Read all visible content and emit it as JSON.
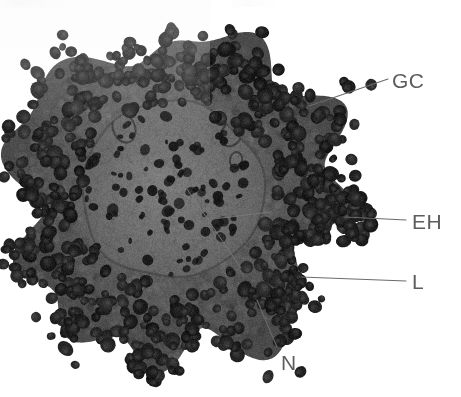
{
  "figure": {
    "kind": "histology-micrograph",
    "stain_tone": "grayscale",
    "background_color": "#ffffff",
    "width_px": 461,
    "height_px": 397
  },
  "specimen": {
    "center_x": 175,
    "center_y": 196,
    "outer_radius": 163,
    "oocyte_center_x": 172,
    "oocyte_center_y": 190,
    "oocyte_radius": 88,
    "matrix_color": "#585858",
    "oocyte_color": "#6d6d6d",
    "cell_color": "#262626",
    "cell_count": 620,
    "inner_nuclei_count": 95
  },
  "annotations": {
    "labels": [
      {
        "id": "gc",
        "text": "GC",
        "meaning": "granulosa cells",
        "color": "#5d5d5d",
        "label_x": 392,
        "label_y": 70,
        "leader": {
          "x1": 388,
          "y1": 79,
          "x2": 309,
          "y2": 106
        }
      },
      {
        "id": "eh",
        "text": "EH",
        "meaning": "epithelial hilus",
        "color": "#5d5d5d",
        "label_x": 412,
        "label_y": 211,
        "leader": {
          "x1": 406,
          "y1": 220,
          "x2": 345,
          "y2": 217
        }
      },
      {
        "id": "l",
        "text": "L",
        "meaning": "lumen",
        "color": "#5d5d5d",
        "label_x": 412,
        "label_y": 271,
        "leader": {
          "x1": 406,
          "y1": 281,
          "x2": 301,
          "y2": 277
        }
      },
      {
        "id": "n",
        "text": "N",
        "meaning": "nucleus",
        "color": "#5d5d5d",
        "label_x": 281,
        "label_y": 352,
        "leader": {
          "x1": 277,
          "y1": 347,
          "x2": 257,
          "y2": 300
        }
      }
    ],
    "internal_pointers": [
      {
        "id": "oocyte-pointer",
        "x1": 178,
        "y1": 176,
        "x2": 241,
        "y2": 268
      },
      {
        "id": "eh-inner-pointer",
        "x1": 213,
        "y1": 219,
        "x2": 271,
        "y2": 212
      }
    ]
  }
}
